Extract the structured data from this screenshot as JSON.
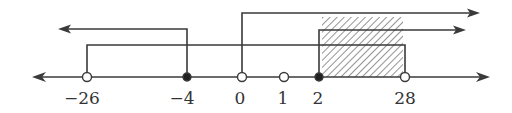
{
  "diagram": {
    "type": "number-line",
    "colors": {
      "line": "#3a3a3a",
      "hatch": "#7a7a7a",
      "filled_point": "#222222",
      "open_point_fill": "#ffffff"
    },
    "ticks": [
      {
        "value": "−26",
        "x": 87,
        "point": "open"
      },
      {
        "value": "−4",
        "x": 187,
        "point": "closed"
      },
      {
        "value": "0",
        "x": 242,
        "point": "open"
      },
      {
        "value": "1",
        "x": 284,
        "point": "open"
      },
      {
        "value": "2",
        "x": 319,
        "point": "closed"
      },
      {
        "value": "28",
        "x": 405,
        "point": "open"
      }
    ],
    "intervals": [
      {
        "name": "x-greater-than-0",
        "from": "0",
        "direction": "right"
      },
      {
        "name": "x-less-or-equal-neg4",
        "from": "−4",
        "direction": "left"
      },
      {
        "name": "x-greater-or-equal-2",
        "from": "2",
        "direction": "right"
      },
      {
        "name": "neg26-to-28",
        "from": "−26",
        "to": "28"
      }
    ],
    "solution_region": {
      "from": "2",
      "to": "28",
      "style": "hatched"
    }
  }
}
